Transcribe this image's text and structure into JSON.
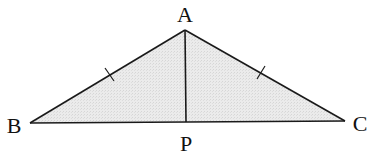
{
  "diagram": {
    "type": "isosceles-triangle-with-altitude",
    "fill_color": "#e6e6e6",
    "stroke_color": "#1a1a1a",
    "points": {
      "A": {
        "label": "A",
        "x": 185,
        "y": 30,
        "label_x": 185,
        "label_y": 22
      },
      "B": {
        "label": "B",
        "x": 30,
        "y": 123,
        "label_x": 14,
        "label_y": 133
      },
      "C": {
        "label": "C",
        "x": 345,
        "y": 121,
        "label_x": 360,
        "label_y": 131
      },
      "P": {
        "label": "P",
        "x": 186,
        "y": 122,
        "label_x": 186,
        "label_y": 151
      }
    },
    "segments": [
      {
        "from": "A",
        "to": "B",
        "tick_marks": 1
      },
      {
        "from": "A",
        "to": "C",
        "tick_marks": 1
      },
      {
        "from": "B",
        "to": "C",
        "tick_marks": 0
      },
      {
        "from": "A",
        "to": "P",
        "tick_marks": 0
      }
    ],
    "annotations": {
      "equal_sides": [
        "AB",
        "AC"
      ]
    }
  }
}
